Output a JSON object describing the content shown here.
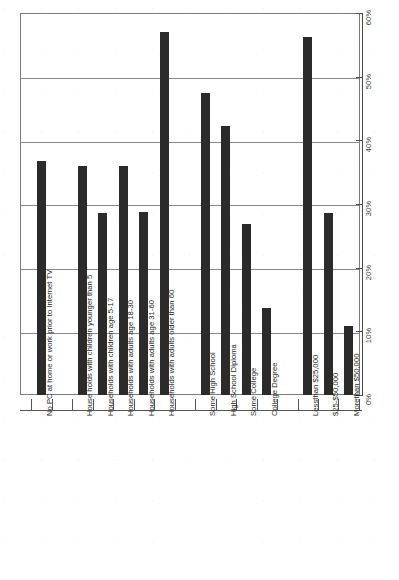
{
  "chart_data": {
    "type": "bar",
    "title": "",
    "xlabel": "",
    "ylabel": "",
    "ylim": [
      0,
      60
    ],
    "y_unit": "%",
    "grid": true,
    "legend": "none",
    "orientation": "vertical",
    "y_ticks": [
      "0%",
      "10%",
      "20%",
      "30%",
      "40%",
      "50%",
      "60%"
    ],
    "y_tick_values": [
      0,
      10,
      20,
      30,
      40,
      50,
      60
    ],
    "bar_color": "#2b2b2b",
    "categories": [
      "No PC at home or work prior to Internet TV",
      "House holds with children younger than 5",
      "Households with children age 5-17",
      "Households with adults age 18-30",
      "Households with adults age 31-60",
      "Households with adults older than 60",
      "Some High School",
      "High School Diploma",
      "Some College",
      "College Degree",
      "Lessthan $25,000",
      "$25-$50,000",
      "Morethan $50,000"
    ],
    "values": [
      36.8,
      36.0,
      28.6,
      36.0,
      28.7,
      57.0,
      47.5,
      42.3,
      26.9,
      13.6,
      56.3,
      28.6,
      10.8
    ],
    "gaps_after": [
      0,
      5,
      9
    ],
    "series": [
      {
        "name": "Percent",
        "values": [
          36.8,
          36.0,
          28.6,
          36.0,
          28.7,
          57.0,
          47.5,
          42.3,
          26.9,
          13.6,
          56.3,
          28.6,
          10.8
        ]
      }
    ]
  }
}
